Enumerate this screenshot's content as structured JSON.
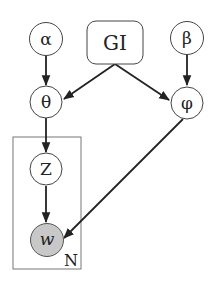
{
  "diagram": {
    "type": "plate-notation-graphical-model",
    "colors": {
      "stroke": "#333333",
      "observed_fill": "#c8c8c8",
      "background": "#ffffff"
    },
    "nodes": [
      {
        "id": "alpha",
        "label": "α",
        "shape": "circle",
        "observed": false
      },
      {
        "id": "gi",
        "label": "GI",
        "shape": "rounded-rect",
        "observed": false
      },
      {
        "id": "beta",
        "label": "β",
        "shape": "circle",
        "observed": false
      },
      {
        "id": "theta",
        "label": "θ",
        "shape": "circle",
        "observed": false
      },
      {
        "id": "phi",
        "label": "φ",
        "shape": "circle",
        "observed": false
      },
      {
        "id": "z",
        "label": "Z",
        "shape": "circle",
        "observed": false
      },
      {
        "id": "w",
        "label": "w",
        "shape": "circle",
        "observed": true
      }
    ],
    "edges": [
      {
        "from": "alpha",
        "to": "theta"
      },
      {
        "from": "gi",
        "to": "theta"
      },
      {
        "from": "gi",
        "to": "phi"
      },
      {
        "from": "beta",
        "to": "phi"
      },
      {
        "from": "theta",
        "to": "z"
      },
      {
        "from": "z",
        "to": "w"
      },
      {
        "from": "phi",
        "to": "w"
      }
    ],
    "plates": [
      {
        "label": "N",
        "contains": [
          "z",
          "w"
        ]
      }
    ]
  }
}
